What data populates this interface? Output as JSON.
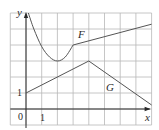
{
  "chart_data": {
    "type": "line",
    "title": "",
    "xlabel": "x",
    "ylabel": "y",
    "xlim": [
      -1,
      8
    ],
    "ylim": [
      -1,
      6
    ],
    "grid": true,
    "tick_labels": {
      "x_origin": "0",
      "x_one": "1",
      "y_one": "1"
    },
    "series": [
      {
        "name": "F",
        "description": "U-shaped curve falling from top near y-axis to minimum at (2,3), rising to corner at (3,4), then a straight line rising to the right edge",
        "points": [
          [
            0.15,
            6.0
          ],
          [
            0.5,
            5.0
          ],
          [
            1.0,
            3.9
          ],
          [
            1.5,
            3.25
          ],
          [
            2.0,
            3.0
          ],
          [
            2.5,
            3.25
          ],
          [
            3.0,
            4.0
          ],
          [
            8.0,
            5.3
          ]
        ]
      },
      {
        "name": "G",
        "description": "Piecewise linear: rises from (0,1) to peak (4,3), then falls to right edge",
        "points": [
          [
            0,
            1
          ],
          [
            4,
            3
          ],
          [
            8,
            0.25
          ]
        ]
      }
    ],
    "annotations": [
      {
        "text": "F",
        "x": 3.6,
        "y": 4.6
      },
      {
        "text": "G",
        "x": 5.3,
        "y": 1.4
      }
    ]
  },
  "colors": {
    "grid": "#b8b8b8",
    "axis": "#2a2a2a",
    "curve": "#555555"
  }
}
